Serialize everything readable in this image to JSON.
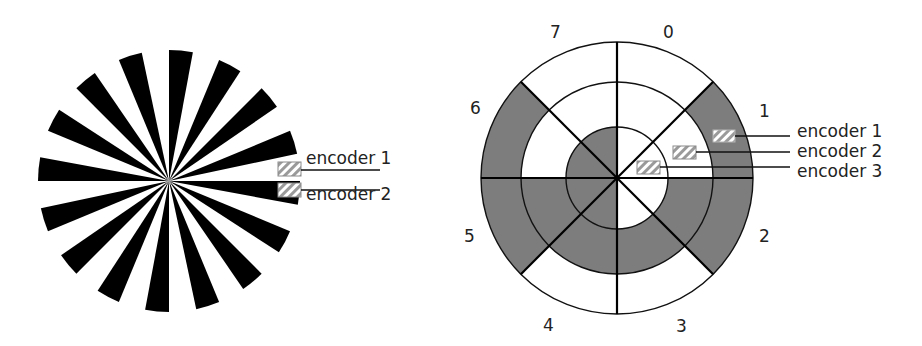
{
  "figure": {
    "left_diagram": {
      "name": "incremental-spoke-disc",
      "spoke_count": 16,
      "spoke_width_deg": 10.5,
      "spoke_color": "#000000",
      "encoders": [
        {
          "label": "encoder 1"
        },
        {
          "label": "encoder 2"
        }
      ]
    },
    "right_diagram": {
      "name": "absolute-3-track-encoder-disc",
      "sector_labels": [
        "0",
        "1",
        "2",
        "3",
        "4",
        "5",
        "6",
        "7"
      ],
      "shade_color": "#7d7d7d",
      "tracks": [
        {
          "ring": "outer",
          "shaded_sectors": [
            1,
            2,
            5,
            6
          ]
        },
        {
          "ring": "middle",
          "shaded_sectors": [
            2,
            3,
            4,
            5
          ]
        },
        {
          "ring": "inner",
          "shaded_sectors": [
            4,
            5,
            6,
            7
          ]
        }
      ],
      "encoders": [
        {
          "label": "encoder 1"
        },
        {
          "label": "encoder 2"
        },
        {
          "label": "encoder 3"
        }
      ]
    }
  }
}
